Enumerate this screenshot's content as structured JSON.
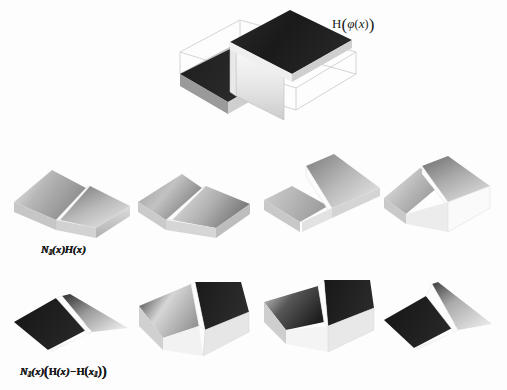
{
  "figure": {
    "background_color": "#fdfdfd",
    "ink_color": "#1b1b1b",
    "width": 507,
    "height": 390
  },
  "top_panel": {
    "label_full": "H(φ(x))",
    "label_H": "H",
    "label_open": "(",
    "label_phi": "φ",
    "label_inner_open": "(",
    "label_x": "x",
    "label_inner_close": ")",
    "label_close": ")",
    "surface_name": "heaviside-step-surface",
    "colors": {
      "dark": "#1f1f1f",
      "mid": "#8f8f8f",
      "light": "#d8d8d8",
      "edge": "#a8a8a8",
      "face": "#efefef"
    }
  },
  "middle_row": {
    "panels": [
      {
        "id": "N1H",
        "label_N": "N",
        "label_sub": "1",
        "label_rest": "(x)H(x)",
        "surface_name": "shape-function-n1-times-heaviside"
      },
      {
        "id": "N2H",
        "label_N": "N",
        "label_sub": "2",
        "label_rest": "(x)H(x)",
        "surface_name": "shape-function-n2-times-heaviside"
      },
      {
        "id": "N3H",
        "label_N": "N",
        "label_sub": "3",
        "label_rest": "(x)H(x)",
        "surface_name": "shape-function-n3-times-heaviside"
      },
      {
        "id": "N4H",
        "label_N": "N",
        "label_sub": "4",
        "label_rest": "(x)H(x)",
        "surface_name": "shape-function-n4-times-heaviside"
      }
    ]
  },
  "bottom_row": {
    "panels": [
      {
        "id": "N1shift",
        "label_N": "N",
        "label_sub": "1",
        "label_mid": "(x)",
        "label_H1": "H",
        "label_x": "(x)",
        "label_minus": "−",
        "label_H2": "H",
        "label_xi": "x",
        "label_xi_sub": "1",
        "surface_name": "shifted-enrichment-n1"
      },
      {
        "id": "N2shift",
        "label_N": "N",
        "label_sub": "2",
        "label_mid": "(x)",
        "label_H1": "H",
        "label_x": "(x)",
        "label_minus": "−",
        "label_H2": "H",
        "label_xi": "x",
        "label_xi_sub": "2",
        "surface_name": "shifted-enrichment-n2"
      },
      {
        "id": "N3shift",
        "label_N": "N",
        "label_sub": "3",
        "label_mid": "(x)",
        "label_H1": "H",
        "label_x": "(x)",
        "label_minus": "−",
        "label_H2": "H",
        "label_xi": "x",
        "label_xi_sub": "3",
        "surface_name": "shifted-enrichment-n3"
      },
      {
        "id": "N4shift",
        "label_N": "N",
        "label_sub": "4",
        "label_mid": "(x)",
        "label_H1": "H",
        "label_x": "(x)",
        "label_minus": "−",
        "label_H2": "H",
        "label_xi": "x",
        "label_xi_sub": "4",
        "surface_name": "shifted-enrichment-n4"
      }
    ]
  }
}
